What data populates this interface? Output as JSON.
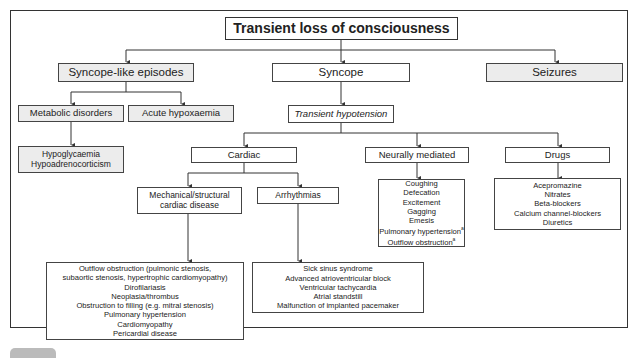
{
  "diagram": {
    "title": "Transient loss of consciousness",
    "level1": {
      "syncope_like": "Syncope-like episodes",
      "syncope": "Syncope",
      "seizures": "Seizures"
    },
    "syncope_like_children": {
      "metabolic": "Metabolic disorders",
      "hypoxaemia": "Acute hypoxaemia",
      "metabolic_list": [
        "Hypoglycaemia",
        "Hypoadrenocorticism"
      ]
    },
    "syncope_children": {
      "transient_hypotension": "Transient hypotension",
      "cardiac": "Cardiac",
      "neurally_mediated": "Neurally mediated",
      "drugs": "Drugs"
    },
    "cardiac_children": {
      "mechanical": "Mechanical/structural cardiac disease",
      "mechanical_line1": "Mechanical/structural",
      "mechanical_line2": "cardiac disease",
      "arrhythmias": "Arrhythmias"
    },
    "mechanical_list": [
      "Outflow obstruction (pulmonic stenosis,",
      "subaortic stenosis, hypertrophic cardiomyopathy)",
      "Dirofilariasis",
      "Neoplasia/thrombus",
      "Obstruction to filling (e.g. mitral stenosis)",
      "Pulmonary hypertension",
      "Cardiomyopathy",
      "Pericardial disease"
    ],
    "arrhythmia_list": [
      "Sick sinus syndrome",
      "Advanced atrioventricular block",
      "Ventricular tachycardia",
      "Atrial standstill",
      "Malfunction of implanted pacemaker"
    ],
    "neural_list": [
      "Coughing",
      "Defecation",
      "Excitement",
      "Gagging",
      "Emesis",
      "Pulmonary hypertension",
      "Outflow obstruction"
    ],
    "neural_footnote_mark": "a",
    "drugs_list": [
      "Acepromazine",
      "Nitrates",
      "Beta-blockers",
      "Calcium channel-blockers",
      "Diuretics"
    ],
    "colors": {
      "line": "#333333",
      "grey_fill": "#ececec",
      "white_fill": "#ffffff"
    }
  }
}
